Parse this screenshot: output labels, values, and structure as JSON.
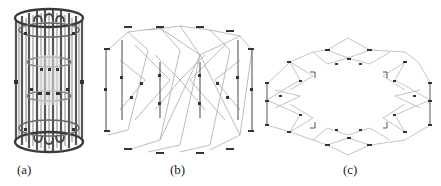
{
  "figure": {
    "panels": [
      {
        "id": "a",
        "label": "(a)",
        "description": "cylindrical cage lattice structure"
      },
      {
        "id": "b",
        "label": "(b)",
        "description": "zigzag expanded lattice structure"
      },
      {
        "id": "c",
        "label": "(c)",
        "description": "flattened ring network structure"
      }
    ],
    "colors": {
      "stroke_dark": "#3a3a3a",
      "stroke_mid": "#7a7a7a",
      "stroke_light": "#b5b5b5",
      "node": "#333333",
      "background": "#ffffff"
    }
  }
}
